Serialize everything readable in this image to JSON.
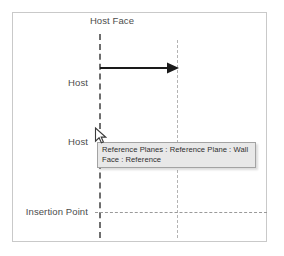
{
  "diagram": {
    "title": "Host Face",
    "type": "revit-reference-plane-diagram",
    "labels": {
      "title": "Host Face",
      "host_upper": "Host",
      "host_lower": "Host",
      "insertion_point": "Insertion Point"
    },
    "annotations": {
      "arrow_direction": "right",
      "arrow_label": ""
    },
    "colors": {
      "frame_border": "#c9c9c9",
      "label_text": "#4c4c4c",
      "major_plane_line": "#6e6e6e",
      "minor_plane_line": "#b4b4b4",
      "insertion_line": "#9a9a9a",
      "arrow": "#1a1a1a",
      "tooltip_background": "#e8e8e8",
      "tooltip_border": "#a3a3a3",
      "tooltip_text": "#2e2e2e",
      "canvas_background": "#ffffff"
    }
  },
  "tooltip": {
    "text": "Reference Planes : Reference Plane : Wall Face : Reference",
    "visible": true
  },
  "cursor": {
    "icon": "arrow-pointer-icon",
    "x": 96,
    "y": 129
  }
}
